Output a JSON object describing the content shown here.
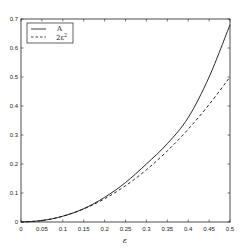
{
  "chart_data": {
    "type": "line",
    "title": "",
    "xlabel": "ε",
    "ylabel": "",
    "xlim": [
      0,
      0.5
    ],
    "ylim": [
      0,
      0.7
    ],
    "grid": false,
    "legend_position": "upper left",
    "x_ticks": [
      "0",
      "0.05",
      "0.1",
      "0.15",
      "0.2",
      "0.25",
      "0.3",
      "0.35",
      "0.4",
      "0.45",
      "0.5"
    ],
    "y_ticks": [
      "0",
      "0.1",
      "0.2",
      "0.3",
      "0.4",
      "0.5",
      "0.6",
      "0.7"
    ],
    "x": [
      0,
      0.05,
      0.1,
      0.15,
      0.2,
      0.25,
      0.3,
      0.35,
      0.4,
      0.45,
      0.5
    ],
    "series": [
      {
        "name": "A",
        "style": "solid",
        "values": [
          0,
          0.005,
          0.02,
          0.046,
          0.085,
          0.136,
          0.2,
          0.27,
          0.36,
          0.5,
          0.68
        ]
      },
      {
        "name": "2ε²",
        "style": "dashed",
        "values": [
          0,
          0.005,
          0.02,
          0.045,
          0.08,
          0.125,
          0.18,
          0.245,
          0.32,
          0.405,
          0.5
        ]
      }
    ]
  },
  "legend": {
    "items": [
      {
        "label": "A",
        "style": "solid"
      },
      {
        "label": "2ε",
        "superscript": "2",
        "style": "dashed"
      }
    ]
  },
  "colors": {
    "line": "#111111",
    "frame": "#222222",
    "background": "#ffffff"
  }
}
